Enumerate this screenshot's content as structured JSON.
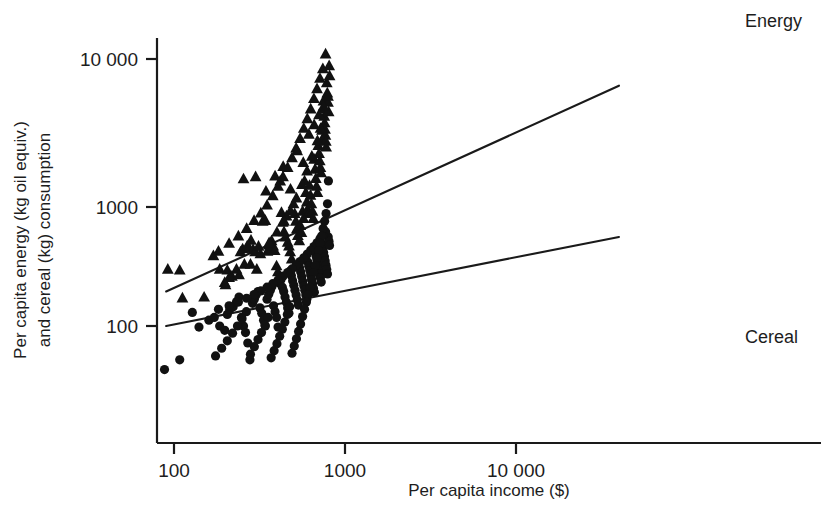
{
  "chart_data": {
    "type": "scatter",
    "title": "",
    "xlabel": "Per capita income ($)",
    "ylabel_line1": "Per capita energy (kg oil equiv.)",
    "ylabel_line2": "and cereal (kg) consumption",
    "xscale": "log",
    "yscale": "log",
    "xlim": [
      85,
      52000
    ],
    "ylim": [
      33,
      16000
    ],
    "grid": false,
    "legend_position": "inline-annotations",
    "xticks": [
      100,
      1000,
      10000
    ],
    "xticklabels": [
      "100",
      "1000",
      "10 000"
    ],
    "yticks": [
      100,
      1000,
      10000
    ],
    "yticklabels": [
      "100",
      "1000",
      "10 000"
    ],
    "annotations": [
      {
        "text": "Energy",
        "x_px": 745,
        "y_px": 27
      },
      {
        "text": "Cereal",
        "x_px": 745,
        "y_px": 343
      }
    ],
    "series": [
      {
        "name": "Energy",
        "marker": "triangle",
        "color": "#111111",
        "label": "Energy",
        "fit_line": {
          "x": [
            90,
            40000
          ],
          "y": [
            195,
            6600
          ]
        },
        "points": [
          [
            92,
            300
          ],
          [
            108,
            295
          ],
          [
            112,
            172
          ],
          [
            150,
            175
          ],
          [
            185,
            300
          ],
          [
            198,
            232
          ],
          [
            205,
            295
          ],
          [
            210,
            255
          ],
          [
            218,
            262
          ],
          [
            232,
            300
          ],
          [
            245,
            420
          ],
          [
            252,
            445
          ],
          [
            258,
            330
          ],
          [
            268,
            470
          ],
          [
            275,
            455
          ],
          [
            282,
            525
          ],
          [
            290,
            440
          ],
          [
            298,
            420
          ],
          [
            305,
            300
          ],
          [
            312,
            468
          ],
          [
            330,
            760
          ],
          [
            342,
            770
          ],
          [
            352,
            425
          ],
          [
            358,
            480
          ],
          [
            365,
            455
          ],
          [
            372,
            520
          ],
          [
            380,
            470
          ],
          [
            388,
            430
          ],
          [
            398,
            320
          ],
          [
            405,
            285
          ],
          [
            418,
            1500
          ],
          [
            425,
            900
          ],
          [
            432,
            745
          ],
          [
            440,
            620
          ],
          [
            448,
            560
          ],
          [
            455,
            840
          ],
          [
            462,
            505
          ],
          [
            470,
            470
          ],
          [
            478,
            420
          ],
          [
            488,
            365
          ],
          [
            500,
            1050
          ],
          [
            508,
            880
          ],
          [
            516,
            760
          ],
          [
            524,
            660
          ],
          [
            530,
            575
          ],
          [
            540,
            520
          ],
          [
            548,
            700
          ],
          [
            556,
            610
          ],
          [
            565,
            920
          ],
          [
            572,
            800
          ],
          [
            580,
            1500
          ],
          [
            590,
            1250
          ],
          [
            598,
            1080
          ],
          [
            605,
            960
          ],
          [
            612,
            880
          ],
          [
            620,
            1400
          ],
          [
            628,
            1200
          ],
          [
            636,
            1050
          ],
          [
            645,
            920
          ],
          [
            652,
            800
          ],
          [
            660,
            2100
          ],
          [
            668,
            1800
          ],
          [
            675,
            1560
          ],
          [
            682,
            1380
          ],
          [
            690,
            1250
          ],
          [
            698,
            2600
          ],
          [
            705,
            2300
          ],
          [
            712,
            2050
          ],
          [
            718,
            1850
          ],
          [
            725,
            1700
          ],
          [
            733,
            3300
          ],
          [
            740,
            2900
          ],
          [
            748,
            5200
          ],
          [
            752,
            4600
          ],
          [
            756,
            4100
          ],
          [
            760,
            3700
          ],
          [
            764,
            3350
          ],
          [
            768,
            3050
          ],
          [
            772,
            2780
          ],
          [
            776,
            2540
          ],
          [
            782,
            6900
          ],
          [
            788,
            5900
          ],
          [
            795,
            5100
          ],
          [
            802,
            4400
          ],
          [
            808,
            9000
          ],
          [
            812,
            7700
          ],
          [
            770,
            10800
          ],
          [
            742,
            8600
          ],
          [
            714,
            7400
          ],
          [
            686,
            6300
          ],
          [
            658,
            5400
          ],
          [
            630,
            4600
          ],
          [
            602,
            3950
          ],
          [
            574,
            3400
          ],
          [
            546,
            2900
          ],
          [
            518,
            2500
          ],
          [
            490,
            2150
          ],
          [
            462,
            1850
          ],
          [
            434,
            1600
          ],
          [
            406,
            1380
          ],
          [
            378,
            1190
          ],
          [
            350,
            1030
          ],
          [
            322,
            890
          ],
          [
            294,
            770
          ],
          [
            266,
            660
          ],
          [
            238,
            570
          ],
          [
            210,
            495
          ],
          [
            182,
            425
          ],
          [
            170,
            390
          ],
          [
            255,
            1550
          ],
          [
            300,
            1600
          ],
          [
            345,
            1280
          ],
          [
            390,
            1620
          ],
          [
            435,
            1880
          ],
          [
            480,
            1320
          ],
          [
            525,
            2400
          ],
          [
            570,
            2000
          ],
          [
            615,
            3100
          ],
          [
            660,
            3600
          ],
          [
            705,
            4200
          ],
          [
            750,
            4800
          ],
          [
            795,
            5600
          ],
          [
            720,
            3400
          ],
          [
            690,
            2800
          ],
          [
            640,
            2200
          ],
          [
            600,
            1750
          ],
          [
            560,
            1420
          ],
          [
            520,
            1150
          ],
          [
            480,
            930
          ],
          [
            440,
            760
          ],
          [
            400,
            615
          ],
          [
            360,
            500
          ],
          [
            320,
            405
          ],
          [
            280,
            330
          ],
          [
            240,
            270
          ],
          [
            200,
            222
          ]
        ]
      },
      {
        "name": "Cereal",
        "marker": "circle",
        "color": "#111111",
        "label": "Cereal",
        "fit_line": {
          "x": [
            90,
            40000
          ],
          "y": [
            100,
            560
          ]
        },
        "points": [
          [
            88,
            43
          ],
          [
            108,
            52
          ],
          [
            128,
            130
          ],
          [
            140,
            98
          ],
          [
            160,
            112
          ],
          [
            172,
            118
          ],
          [
            185,
            100
          ],
          [
            198,
            92
          ],
          [
            205,
            125
          ],
          [
            212,
            138
          ],
          [
            222,
            145
          ],
          [
            232,
            160
          ],
          [
            240,
            175
          ],
          [
            248,
            118
          ],
          [
            255,
            100
          ],
          [
            262,
            88
          ],
          [
            270,
            72
          ],
          [
            278,
            52
          ],
          [
            288,
            155
          ],
          [
            295,
            168
          ],
          [
            302,
            182
          ],
          [
            310,
            195
          ],
          [
            318,
            142
          ],
          [
            326,
            128
          ],
          [
            334,
            112
          ],
          [
            342,
            100
          ],
          [
            350,
            168
          ],
          [
            358,
            185
          ],
          [
            366,
            200
          ],
          [
            374,
            215
          ],
          [
            382,
            148
          ],
          [
            390,
            132
          ],
          [
            398,
            118
          ],
          [
            406,
            98
          ],
          [
            414,
            230
          ],
          [
            422,
            245
          ],
          [
            430,
            212
          ],
          [
            438,
            195
          ],
          [
            446,
            175
          ],
          [
            454,
            158
          ],
          [
            462,
            142
          ],
          [
            470,
            128
          ],
          [
            478,
            290
          ],
          [
            486,
            265
          ],
          [
            494,
            240
          ],
          [
            502,
            220
          ],
          [
            510,
            200
          ],
          [
            518,
            182
          ],
          [
            526,
            165
          ],
          [
            534,
            150
          ],
          [
            542,
            310
          ],
          [
            550,
            285
          ],
          [
            558,
            260
          ],
          [
            566,
            238
          ],
          [
            574,
            218
          ],
          [
            582,
            200
          ],
          [
            590,
            182
          ],
          [
            598,
            168
          ],
          [
            606,
            345
          ],
          [
            614,
            318
          ],
          [
            622,
            292
          ],
          [
            630,
            268
          ],
          [
            638,
            246
          ],
          [
            646,
            226
          ],
          [
            654,
            208
          ],
          [
            662,
            192
          ],
          [
            670,
            420
          ],
          [
            678,
            385
          ],
          [
            686,
            355
          ],
          [
            694,
            326
          ],
          [
            702,
            300
          ],
          [
            710,
            276
          ],
          [
            718,
            254
          ],
          [
            726,
            234
          ],
          [
            734,
            490
          ],
          [
            742,
            450
          ],
          [
            750,
            415
          ],
          [
            758,
            382
          ],
          [
            766,
            352
          ],
          [
            774,
            324
          ],
          [
            782,
            298
          ],
          [
            790,
            274
          ],
          [
            798,
            560
          ],
          [
            806,
            515
          ],
          [
            812,
            475
          ],
          [
            770,
            620
          ],
          [
            742,
            580
          ],
          [
            714,
            540
          ],
          [
            686,
            500
          ],
          [
            658,
            465
          ],
          [
            630,
            432
          ],
          [
            602,
            402
          ],
          [
            574,
            374
          ],
          [
            546,
            348
          ],
          [
            518,
            324
          ],
          [
            490,
            302
          ],
          [
            462,
            281
          ],
          [
            434,
            262
          ],
          [
            406,
            244
          ],
          [
            378,
            227
          ],
          [
            350,
            212
          ],
          [
            322,
            197
          ],
          [
            294,
            184
          ],
          [
            266,
            171
          ],
          [
            238,
            159
          ],
          [
            210,
            148
          ],
          [
            182,
            138
          ],
          [
            800,
            1500
          ],
          [
            790,
            1050
          ],
          [
            775,
            880
          ],
          [
            760,
            760
          ],
          [
            745,
            660
          ],
          [
            730,
            570
          ],
          [
            715,
            495
          ],
          [
            700,
            430
          ],
          [
            685,
            372
          ],
          [
            670,
            322
          ],
          [
            655,
            280
          ],
          [
            640,
            243
          ],
          [
            625,
            211
          ],
          [
            610,
            183
          ],
          [
            595,
            159
          ],
          [
            580,
            138
          ],
          [
            565,
            120
          ],
          [
            550,
            104
          ],
          [
            535,
            90
          ],
          [
            520,
            78
          ],
          [
            505,
            68
          ],
          [
            490,
            59
          ],
          [
            475,
            145
          ],
          [
            460,
            125
          ],
          [
            445,
            108
          ],
          [
            430,
            94
          ],
          [
            415,
            82
          ],
          [
            400,
            71
          ],
          [
            385,
            62
          ],
          [
            370,
            54
          ],
          [
            355,
            118
          ],
          [
            340,
            102
          ],
          [
            325,
            88
          ],
          [
            310,
            77
          ],
          [
            295,
            67
          ],
          [
            280,
            58
          ],
          [
            265,
            132
          ],
          [
            250,
            115
          ],
          [
            235,
            100
          ],
          [
            220,
            87
          ],
          [
            205,
            75
          ],
          [
            190,
            65
          ],
          [
            175,
            56
          ]
        ]
      }
    ]
  },
  "axes": {
    "x_axis_name": "x-axis",
    "y_axis_name": "y-axis"
  }
}
